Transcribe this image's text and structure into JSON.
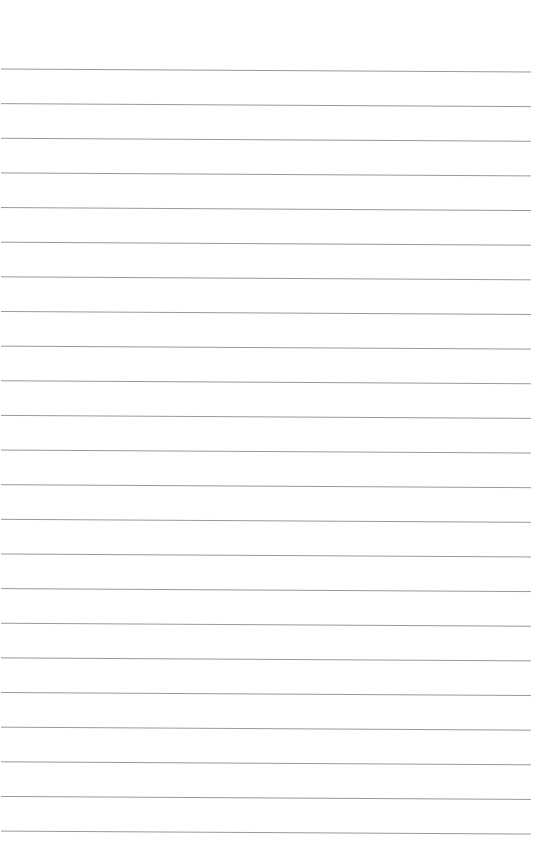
{
  "page": {
    "type": "lined-paper",
    "background_color": "#ffffff",
    "width": 533,
    "height": 866
  },
  "rules": {
    "count": 23,
    "first_line_y_left": 69,
    "spacing": 34.64,
    "slope_right_offset": 3,
    "x_start": 1,
    "x_end": 531,
    "color": "#9a9a9a",
    "thickness": 1
  }
}
